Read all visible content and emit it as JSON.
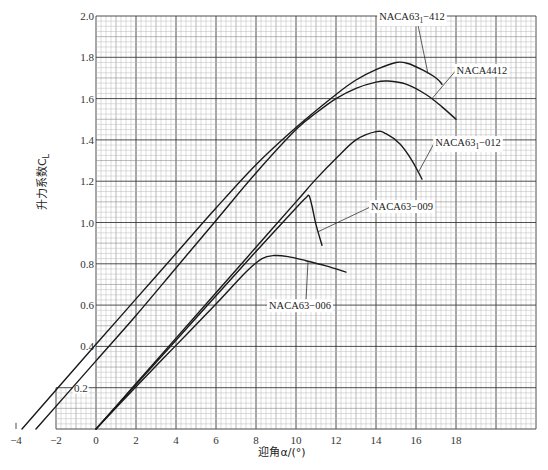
{
  "chart_data": {
    "type": "line",
    "title": "",
    "xlabel": "迎角α/(°)",
    "ylabel": "升力系数C",
    "ylabel_subscript": "L",
    "xlim": [
      -4,
      22
    ],
    "ylim": [
      0,
      2.0
    ],
    "grid": true,
    "x_ticks": [
      -4,
      -2,
      0,
      2,
      4,
      6,
      8,
      10,
      12,
      14,
      16,
      18
    ],
    "x_tick_labels": [
      "−4",
      "−2",
      "0",
      "2",
      "4",
      "6",
      "8",
      "10",
      "12",
      "14",
      "16",
      "18"
    ],
    "y_ticks": [
      0.2,
      0.4,
      0.6,
      0.8,
      1.0,
      1.2,
      1.4,
      1.6,
      1.8,
      2.0
    ],
    "y_tick_labels": [
      "0.2",
      "0.4",
      "0.6",
      "0.8",
      "1.0",
      "1.2",
      "1.4",
      "1.6",
      "1.8",
      "2.0"
    ],
    "series": [
      {
        "name": "NACA63₁−412",
        "label_main": "NACA63",
        "label_sub": "1",
        "label_tail": "−412",
        "points": [
          [
            -3.7,
            0.0
          ],
          [
            0,
            0.41
          ],
          [
            2,
            0.63
          ],
          [
            4,
            0.85
          ],
          [
            6,
            1.07
          ],
          [
            8,
            1.28
          ],
          [
            10,
            1.46
          ],
          [
            12,
            1.62
          ],
          [
            13,
            1.69
          ],
          [
            14,
            1.74
          ],
          [
            15,
            1.775
          ],
          [
            15.6,
            1.77
          ],
          [
            16.3,
            1.74
          ],
          [
            17.0,
            1.7
          ],
          [
            17.3,
            1.67
          ]
        ]
      },
      {
        "name": "NACA4412",
        "label_main": "NACA4412",
        "label_sub": "",
        "label_tail": "",
        "points": [
          [
            -3.0,
            0.0
          ],
          [
            0,
            0.33
          ],
          [
            2,
            0.55
          ],
          [
            4,
            0.78
          ],
          [
            6,
            1.01
          ],
          [
            8,
            1.24
          ],
          [
            10,
            1.45
          ],
          [
            11,
            1.53
          ],
          [
            12,
            1.6
          ],
          [
            13,
            1.65
          ],
          [
            14,
            1.68
          ],
          [
            14.6,
            1.685
          ],
          [
            15.5,
            1.67
          ],
          [
            16.5,
            1.62
          ],
          [
            17.3,
            1.56
          ],
          [
            18.0,
            1.5
          ]
        ]
      },
      {
        "name": "NACA63₁−012",
        "label_main": "NACA63",
        "label_sub": "1",
        "label_tail": "−012",
        "points": [
          [
            0,
            0.0
          ],
          [
            2,
            0.22
          ],
          [
            4,
            0.44
          ],
          [
            6,
            0.66
          ],
          [
            8,
            0.88
          ],
          [
            10,
            1.1
          ],
          [
            11,
            1.21
          ],
          [
            12,
            1.31
          ],
          [
            13,
            1.4
          ],
          [
            14,
            1.44
          ],
          [
            14.5,
            1.43
          ],
          [
            15.2,
            1.38
          ],
          [
            15.8,
            1.3
          ],
          [
            16.3,
            1.21
          ]
        ]
      },
      {
        "name": "NACA63−009",
        "label_main": "NACA63−009",
        "label_sub": "",
        "label_tail": "",
        "points": [
          [
            0,
            0.0
          ],
          [
            2,
            0.215
          ],
          [
            4,
            0.43
          ],
          [
            6,
            0.645
          ],
          [
            8,
            0.86
          ],
          [
            10,
            1.07
          ],
          [
            10.5,
            1.12
          ],
          [
            10.65,
            1.13
          ],
          [
            10.8,
            1.08
          ],
          [
            11.0,
            0.99
          ],
          [
            11.3,
            0.89
          ]
        ]
      },
      {
        "name": "NACA63−006",
        "label_main": "NACA63−006",
        "label_sub": "",
        "label_tail": "",
        "points": [
          [
            0,
            0.0
          ],
          [
            2,
            0.205
          ],
          [
            4,
            0.405
          ],
          [
            6,
            0.605
          ],
          [
            7.5,
            0.76
          ],
          [
            8.3,
            0.825
          ],
          [
            8.9,
            0.84
          ],
          [
            9.6,
            0.835
          ],
          [
            10.5,
            0.815
          ],
          [
            11.5,
            0.79
          ],
          [
            12.5,
            0.76
          ]
        ]
      }
    ],
    "annotations": [
      {
        "series": "NACA63₁−412",
        "text": "NACA63₁−412",
        "label_at": [
          15.8,
          1.98
        ],
        "point": [
          16.6,
          1.72
        ]
      },
      {
        "series": "NACA4412",
        "text": "NACA4412",
        "label_at": [
          19.3,
          1.72
        ],
        "point": [
          16.8,
          1.6
        ]
      },
      {
        "series": "NACA63₁−012",
        "text": "NACA63₁−012",
        "label_at": [
          18.6,
          1.37
        ],
        "point": [
          16.1,
          1.24
        ]
      },
      {
        "series": "NACA63−009",
        "text": "NACA63−009",
        "label_at": [
          15.3,
          1.06
        ],
        "point": [
          11.1,
          0.955
        ]
      },
      {
        "series": "NACA63−006",
        "text": "NACA63−006",
        "label_at": [
          10.2,
          0.58
        ],
        "point": [
          10.6,
          0.81
        ]
      }
    ]
  }
}
